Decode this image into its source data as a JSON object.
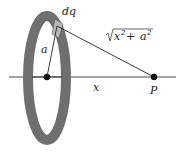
{
  "diagram": {
    "labels": {
      "dq": "dq",
      "a": "a",
      "x": "x",
      "P": "P",
      "distance_radicand_x": "x",
      "distance_exp": "2",
      "distance_plus": " + ",
      "distance_radicand_a": "a"
    },
    "colors": {
      "ring": "#6f6f6f",
      "ring_segment": "#b9b9b9",
      "line": "#333333",
      "point": "#111111"
    }
  }
}
